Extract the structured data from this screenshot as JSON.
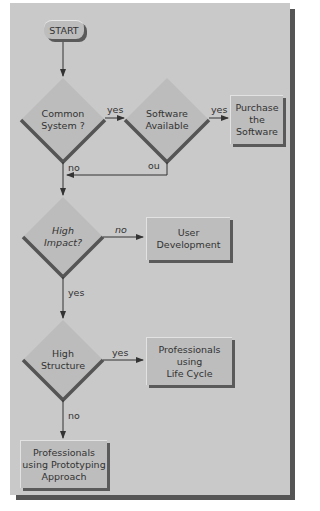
{
  "flowchart": {
    "start": "START",
    "decisions": [
      {
        "id": "common-system",
        "line1": "Common",
        "line2": "System ?"
      },
      {
        "id": "software-available",
        "line1": "Software",
        "line2": "Available"
      },
      {
        "id": "high-impact",
        "line1": "High",
        "line2": "Impact?"
      },
      {
        "id": "high-structure",
        "line1": "High",
        "line2": "Structure"
      }
    ],
    "outcomes": [
      {
        "id": "purchase",
        "line1": "Purchase",
        "line2": "the",
        "line3": "Software"
      },
      {
        "id": "user-development",
        "line1": "User",
        "line2": "Development"
      },
      {
        "id": "life-cycle",
        "line1": "Professionals",
        "line2": "using",
        "line3": "Life Cycle"
      },
      {
        "id": "prototyping",
        "line1": "Professionals",
        "line2": "using Prototyping",
        "line3": "Approach"
      }
    ],
    "edge_labels": {
      "common_yes": "yes",
      "common_no": "no",
      "software_yes": "yes",
      "software_no": "no",
      "impact_no": "no",
      "impact_yes": "yes",
      "structure_yes": "yes",
      "structure_no": "no"
    }
  },
  "colors": {
    "panel": "#c9c9c9",
    "shadow": "#555555",
    "line": "#333333"
  }
}
